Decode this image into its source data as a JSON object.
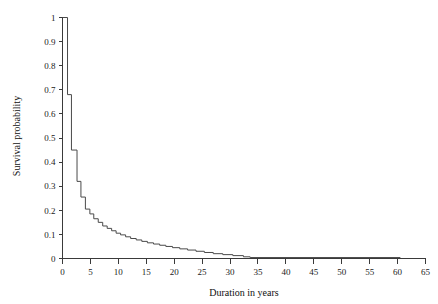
{
  "chart_data": {
    "type": "line",
    "title": "",
    "subtitle": "",
    "xlabel": "Duration in years",
    "ylabel": "Survival probability",
    "xlim": [
      0,
      65
    ],
    "ylim": [
      0,
      1
    ],
    "grid": false,
    "legend": null,
    "step_style": "post",
    "xticks": [
      0,
      5,
      10,
      15,
      20,
      25,
      30,
      35,
      40,
      45,
      50,
      55,
      60,
      65
    ],
    "xtick_labels": [
      "0",
      "5",
      "10",
      "15",
      "20",
      "25",
      "30",
      "35",
      "40",
      "45",
      "50",
      "55",
      "60",
      "65"
    ],
    "yticks": [
      0,
      0.1,
      0.2,
      0.3,
      0.4,
      0.5,
      0.6,
      0.7,
      0.8,
      0.9,
      1
    ],
    "ytick_labels": [
      "0",
      "0.1",
      "0.2",
      "0.3",
      "0.4",
      "0.5",
      "0.6",
      "0.7",
      "0.8",
      "0.9",
      "1"
    ],
    "series": [
      {
        "name": "Kaplan-Meier survival",
        "color": "#4a4a4a",
        "x": [
          0,
          0.9,
          0.9,
          1.6,
          1.6,
          2.6,
          2.6,
          3.3,
          3.3,
          4.1,
          4.1,
          4.9,
          4.9,
          5.6,
          5.6,
          6.4,
          6.4,
          7.2,
          7.2,
          8.0,
          8.0,
          8.8,
          8.8,
          9.6,
          9.6,
          10.4,
          10.4,
          11.3,
          11.3,
          12.2,
          12.2,
          13.2,
          13.2,
          14.2,
          14.2,
          15.2,
          15.2,
          16.3,
          16.3,
          17.4,
          17.4,
          18.5,
          18.5,
          19.7,
          19.7,
          21.0,
          21.0,
          22.4,
          22.4,
          23.9,
          23.9,
          25.4,
          25.4,
          27.0,
          27.0,
          28.7,
          28.7,
          30.5,
          30.5,
          32.4,
          32.4,
          33.6,
          33.6,
          60.5
        ],
        "y": [
          1.0,
          1.0,
          0.68,
          0.68,
          0.45,
          0.45,
          0.32,
          0.32,
          0.255,
          0.255,
          0.205,
          0.205,
          0.185,
          0.185,
          0.165,
          0.165,
          0.15,
          0.15,
          0.135,
          0.135,
          0.125,
          0.125,
          0.115,
          0.115,
          0.105,
          0.105,
          0.098,
          0.098,
          0.09,
          0.09,
          0.083,
          0.083,
          0.077,
          0.077,
          0.071,
          0.071,
          0.065,
          0.065,
          0.06,
          0.06,
          0.055,
          0.055,
          0.05,
          0.05,
          0.045,
          0.045,
          0.04,
          0.04,
          0.035,
          0.035,
          0.03,
          0.03,
          0.025,
          0.025,
          0.02,
          0.02,
          0.016,
          0.016,
          0.012,
          0.012,
          0.007,
          0.007,
          0.004,
          0.004
        ]
      }
    ]
  }
}
